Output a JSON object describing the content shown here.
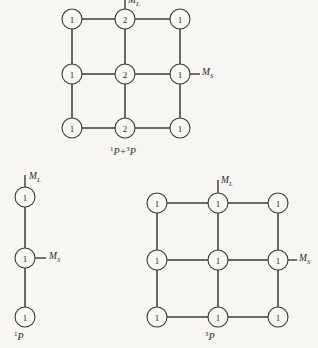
{
  "figure": {
    "background_color": "#f7f6f3",
    "line_color": "#3a3a3a",
    "node_fill": "#f7f6f3",
    "node_radius": 10,
    "diagrams": [
      {
        "id": "combined-term-diagram",
        "caption_prefix_sup": "1",
        "caption_mid": "P+",
        "caption_sup2": "3",
        "caption_tail": "P",
        "caption_text": "1P+3P",
        "axis_ml": "M",
        "axis_ml_sub": "L",
        "axis_ms": "M",
        "axis_ms_sub": "S",
        "columns_x": [
          72,
          125,
          180
        ],
        "rows_y": [
          19,
          74,
          128
        ],
        "caption_x": 110,
        "caption_y": 147,
        "ml_tick": {
          "x": 125,
          "y_top": -4,
          "y_bottom": 9
        },
        "ml_label_x": 128,
        "ml_label_y": -4,
        "ms_tick": {
          "y": 74,
          "x_left": 190,
          "x_right": 200
        },
        "ms_label_x": 202,
        "ms_label_y": 68,
        "nodes": [
          {
            "row": 0,
            "col": 0,
            "value": "1"
          },
          {
            "row": 0,
            "col": 1,
            "value": "2"
          },
          {
            "row": 0,
            "col": 2,
            "value": "1"
          },
          {
            "row": 1,
            "col": 0,
            "value": "1"
          },
          {
            "row": 1,
            "col": 1,
            "value": "2"
          },
          {
            "row": 1,
            "col": 2,
            "value": "1"
          },
          {
            "row": 2,
            "col": 0,
            "value": "1"
          },
          {
            "row": 2,
            "col": 1,
            "value": "2"
          },
          {
            "row": 2,
            "col": 2,
            "value": "1"
          }
        ]
      },
      {
        "id": "singlet-p-diagram",
        "caption_prefix_sup": "1",
        "caption_tail": "P",
        "caption_text": "1P",
        "axis_ml": "M",
        "axis_ml_sub": "L",
        "axis_ms": "M",
        "axis_ms_sub": "S",
        "columns_x": [
          25
        ],
        "rows_y": [
          197,
          258,
          317
        ],
        "caption_x": 14,
        "caption_y": 332,
        "ml_tick": {
          "x": 25,
          "y_top": 175,
          "y_bottom": 187
        },
        "ml_label_x": 29,
        "ml_label_y": 172,
        "ms_tick": {
          "y": 258,
          "x_left": 35,
          "x_right": 46
        },
        "ms_label_x": 49,
        "ms_label_y": 252,
        "nodes": [
          {
            "row": 0,
            "col": 0,
            "value": "1"
          },
          {
            "row": 1,
            "col": 0,
            "value": "1"
          },
          {
            "row": 2,
            "col": 0,
            "value": "1"
          }
        ]
      },
      {
        "id": "triplet-p-diagram",
        "caption_prefix_sup": "3",
        "caption_tail": "P",
        "caption_text": "3P",
        "axis_ml": "M",
        "axis_ml_sub": "L",
        "axis_ms": "M",
        "axis_ms_sub": "S",
        "columns_x": [
          157,
          218,
          278
        ],
        "rows_y": [
          203,
          260,
          317
        ],
        "caption_x": 205,
        "caption_y": 332,
        "ml_tick": {
          "x": 218,
          "y_top": 180,
          "y_bottom": 193
        },
        "ml_label_x": 221,
        "ml_label_y": 176,
        "ms_tick": {
          "y": 260,
          "x_left": 288,
          "x_right": 297
        },
        "ms_label_x": 299,
        "ms_label_y": 254,
        "nodes": [
          {
            "row": 0,
            "col": 0,
            "value": "1"
          },
          {
            "row": 0,
            "col": 1,
            "value": "1"
          },
          {
            "row": 0,
            "col": 2,
            "value": "1"
          },
          {
            "row": 1,
            "col": 0,
            "value": "1"
          },
          {
            "row": 1,
            "col": 1,
            "value": "1"
          },
          {
            "row": 1,
            "col": 2,
            "value": "1"
          },
          {
            "row": 2,
            "col": 0,
            "value": "1"
          },
          {
            "row": 2,
            "col": 1,
            "value": "1"
          },
          {
            "row": 2,
            "col": 2,
            "value": "1"
          }
        ]
      }
    ]
  }
}
